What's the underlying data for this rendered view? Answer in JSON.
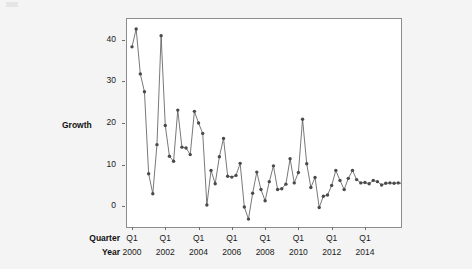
{
  "figure": {
    "y_axis_title": "Growth",
    "row_label_quarter": "Quarter",
    "row_label_year": "Year"
  },
  "chart_data": {
    "type": "line",
    "title": "",
    "xlabel": "Quarter / Year",
    "ylabel": "Growth",
    "ylim": [
      -5,
      45
    ],
    "yticks": [
      0,
      10,
      20,
      30,
      40
    ],
    "grid": false,
    "legend": null,
    "marker": "filled-circle",
    "line_color": "#555555",
    "marker_color": "#4a4a4a",
    "x_tick_labels": [
      {
        "quarter": "Q1",
        "year": "2000"
      },
      {
        "quarter": "Q1",
        "year": "2002"
      },
      {
        "quarter": "Q1",
        "year": "2004"
      },
      {
        "quarter": "Q1",
        "year": "2006"
      },
      {
        "quarter": "Q1",
        "year": "2008"
      },
      {
        "quarter": "Q1",
        "year": "2010"
      },
      {
        "quarter": "Q1",
        "year": "2012"
      },
      {
        "quarter": "Q1",
        "year": "2014"
      }
    ],
    "x": [
      "2000 Q1",
      "2000 Q2",
      "2000 Q3",
      "2000 Q4",
      "2001 Q1",
      "2001 Q2",
      "2001 Q3",
      "2001 Q4",
      "2002 Q1",
      "2002 Q2",
      "2002 Q3",
      "2002 Q4",
      "2003 Q1",
      "2003 Q2",
      "2003 Q3",
      "2003 Q4",
      "2004 Q1",
      "2004 Q2",
      "2004 Q3",
      "2004 Q4",
      "2005 Q1",
      "2005 Q2",
      "2005 Q3",
      "2005 Q4",
      "2006 Q1",
      "2006 Q2",
      "2006 Q3",
      "2006 Q4",
      "2007 Q1",
      "2007 Q2",
      "2007 Q3",
      "2007 Q4",
      "2008 Q1",
      "2008 Q2",
      "2008 Q3",
      "2008 Q4",
      "2009 Q1",
      "2009 Q2",
      "2009 Q3",
      "2009 Q4",
      "2010 Q1",
      "2010 Q2",
      "2010 Q3",
      "2010 Q4",
      "2011 Q1",
      "2011 Q2",
      "2011 Q3",
      "2011 Q4",
      "2012 Q1",
      "2012 Q2",
      "2012 Q3",
      "2012 Q4",
      "2013 Q1",
      "2013 Q2",
      "2013 Q3",
      "2013 Q4",
      "2014 Q1",
      "2014 Q2",
      "2014 Q3",
      "2014 Q4",
      "2015 Q1",
      "2015 Q2",
      "2015 Q3",
      "2015 Q4",
      "2016 Q1",
      "2016 Q2"
    ],
    "values": [
      38.3,
      42.6,
      31.8,
      27.5,
      7.8,
      3.0,
      14.8,
      41.0,
      19.4,
      12.0,
      10.8,
      23.1,
      14.2,
      14.0,
      12.4,
      22.8,
      20.0,
      17.5,
      0.3,
      8.6,
      5.4,
      11.9,
      16.3,
      7.2,
      7.0,
      7.4,
      10.3,
      -0.2,
      -3.1,
      3.1,
      8.2,
      4.0,
      1.3,
      5.9,
      9.7,
      4.0,
      4.2,
      5.3,
      11.4,
      5.6,
      8.1,
      20.9,
      10.2,
      4.5,
      6.9,
      -0.3,
      2.4,
      2.7,
      5.0,
      8.6,
      6.2,
      4.0,
      6.7,
      8.6,
      6.4,
      5.6,
      5.7,
      5.4,
      6.2,
      5.9,
      5.1,
      5.5,
      5.6,
      5.5,
      5.6,
      5.5
    ]
  }
}
